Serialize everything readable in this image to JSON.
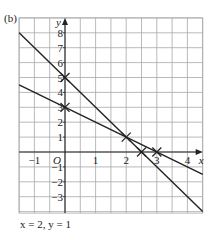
{
  "part_label": "(b)",
  "answer_text": "x = 2, y = 1",
  "chart_data": {
    "type": "line",
    "title": "",
    "xlabel": "x",
    "ylabel": "y",
    "origin_label": "O",
    "xlim": [
      -1.5,
      4.5
    ],
    "ylim": [
      -4.1,
      9
    ],
    "x_grid_step": 0.5,
    "y_grid_step": 1,
    "grid": true,
    "x_ticks": [
      -1,
      1,
      2,
      3,
      4
    ],
    "x_tick_labels": [
      "−1",
      "1",
      "2",
      "3",
      "4"
    ],
    "y_ticks": [
      8,
      7,
      6,
      5,
      4,
      3,
      2,
      1,
      -1,
      -2,
      -3
    ],
    "y_tick_labels": [
      "8",
      "7",
      "6",
      "5",
      "4",
      "3",
      "2",
      "1",
      "−1",
      "−2",
      "−3"
    ],
    "series": [
      {
        "name": "y = 5 − 2x",
        "x": [
          -1.5,
          4.5
        ],
        "values": [
          8,
          -4
        ]
      },
      {
        "name": "y = 3 − x",
        "x": [
          -1.5,
          4.5
        ],
        "values": [
          4.5,
          -1.5
        ]
      }
    ],
    "marked_points": [
      {
        "x": 0,
        "y": 5
      },
      {
        "x": 0,
        "y": 3
      },
      {
        "x": 2,
        "y": 1
      },
      {
        "x": 2.5,
        "y": 0
      },
      {
        "x": 3,
        "y": 0
      }
    ],
    "colors": {
      "grid": "#a8a8a8",
      "axes": "#222222",
      "lines": "#222222"
    }
  }
}
